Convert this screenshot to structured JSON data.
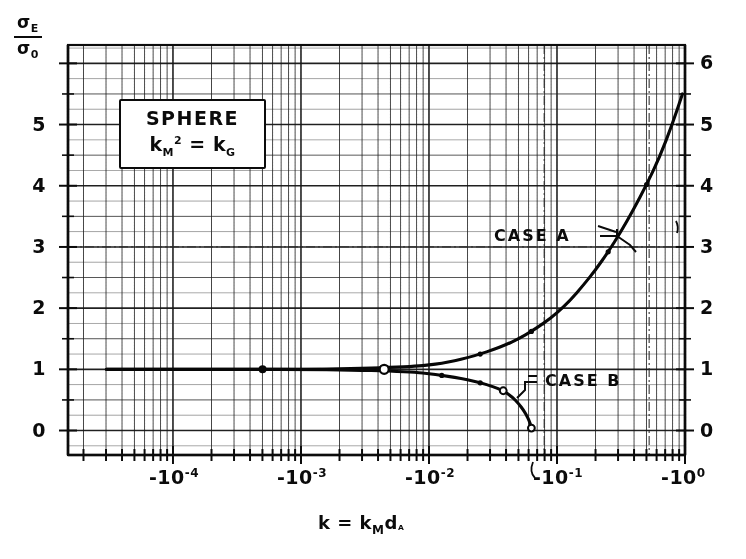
{
  "figure": {
    "title_box": {
      "line1": "SPHERE",
      "line2_base": "k",
      "line2_sub": "M",
      "line2_sup": "2",
      "line2_eq": "=",
      "line2_rhs_base": "k",
      "line2_rhs_sub": "G"
    },
    "y_axis_label": {
      "numerator": "σ",
      "numerator_sub": "E",
      "denominator": "σ",
      "denominator_sub": "0"
    },
    "x_axis_label": {
      "text": "k = k",
      "sub1": "M",
      "mid": "d",
      "sub2": "ᴬ"
    },
    "annotations": [
      {
        "name": "case-a-label",
        "text": "CASE A"
      },
      {
        "name": "case-b-label",
        "text": "CASE B"
      }
    ]
  },
  "chart_data": {
    "type": "line",
    "xlabel": "k = k_M d_A",
    "ylabel": "σ_E / σ_0",
    "x_scale": "log-negative",
    "xlim": [
      -3e-05,
      -1.0
    ],
    "x_tick_labels": [
      "-10⁻⁴",
      "-10⁻³",
      "-10⁻²",
      "-10⁻¹",
      "-10⁰"
    ],
    "x_tick_exponents": [
      -4,
      -3,
      -2,
      -1,
      0
    ],
    "ylim": [
      -0.4,
      6.3
    ],
    "y_ticks": [
      0,
      1,
      2,
      3,
      4,
      5,
      6
    ],
    "y_tick_labels": [
      "0",
      "1",
      "2",
      "3",
      "4",
      "5",
      "6"
    ],
    "grid": true,
    "grid_minor": true,
    "legend_position": "inside-upper-left",
    "series": [
      {
        "name": "CASE A",
        "points_log10x": [
          -4.52,
          -4.2,
          -3.8,
          -3.4,
          -3.0,
          -2.6,
          -2.3,
          -2.1,
          -2.0,
          -1.9,
          -1.8,
          -1.7,
          -1.6,
          -1.5,
          -1.4,
          -1.3,
          -1.2,
          -1.1,
          -1.0,
          -0.9,
          -0.8,
          -0.7,
          -0.6,
          -0.5,
          -0.4,
          -0.3,
          -0.2,
          -0.1,
          -0.02
        ],
        "values": [
          1.0,
          1.0,
          1.0,
          1.0,
          1.0,
          1.01,
          1.03,
          1.05,
          1.07,
          1.1,
          1.14,
          1.19,
          1.25,
          1.32,
          1.4,
          1.5,
          1.62,
          1.76,
          1.92,
          2.12,
          2.36,
          2.62,
          2.92,
          3.25,
          3.62,
          4.02,
          4.46,
          5.0,
          5.5
        ]
      },
      {
        "name": "CASE B",
        "points_log10x": [
          -4.52,
          -4.2,
          -3.8,
          -3.4,
          -3.0,
          -2.6,
          -2.3,
          -2.1,
          -2.0,
          -1.9,
          -1.8,
          -1.7,
          -1.6,
          -1.5,
          -1.42,
          -1.35,
          -1.3,
          -1.26,
          -1.23,
          -1.21,
          -1.2
        ],
        "values": [
          1.0,
          1.0,
          1.0,
          1.0,
          1.0,
          0.99,
          0.97,
          0.95,
          0.93,
          0.9,
          0.87,
          0.83,
          0.78,
          0.72,
          0.65,
          0.55,
          0.44,
          0.33,
          0.22,
          0.12,
          0.04
        ]
      }
    ],
    "markers": [
      {
        "label": "left-dot",
        "log10x": -3.3,
        "value": 1.0
      },
      {
        "label": "branch-circle",
        "log10x": -2.35,
        "value": 1.0
      }
    ]
  }
}
